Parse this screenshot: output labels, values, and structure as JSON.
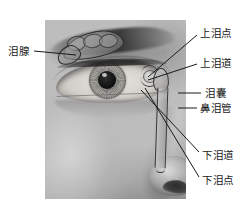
{
  "figure": {
    "type": "anatomical-diagram",
    "width": 252,
    "height": 211,
    "background_color": "#ffffff",
    "label_color": "#1a1a1a",
    "leader_line_color": "#1a1a1a"
  },
  "photo": {
    "description": "灰度人脸照片，显示左眼、眉毛、鼻侧",
    "left": 45,
    "top": 20,
    "width": 141,
    "height": 179
  },
  "labels": [
    {
      "id": "lacrimal-gland",
      "text": "泪腺",
      "side": "left",
      "text_x": 8,
      "text_y": 46,
      "leader": {
        "x1": 34,
        "y1": 51,
        "x2": 76,
        "y2": 55
      }
    },
    {
      "id": "superior-punctum",
      "text": "上泪点",
      "side": "right",
      "text_x": 200,
      "text_y": 28,
      "leader": {
        "x1": 197,
        "y1": 35,
        "x2": 148,
        "y2": 77
      }
    },
    {
      "id": "superior-canaliculus",
      "text": "上泪道",
      "side": "right",
      "text_x": 200,
      "text_y": 58,
      "leader": {
        "x1": 197,
        "y1": 64,
        "x2": 148,
        "y2": 80
      }
    },
    {
      "id": "lacrimal-sac",
      "text": "泪囊",
      "side": "right",
      "text_x": 205,
      "text_y": 88,
      "leader": {
        "x1": 201,
        "y1": 93,
        "x2": 178,
        "y2": 93
      }
    },
    {
      "id": "nasolacrimal-duct",
      "text": "鼻泪管",
      "side": "right",
      "text_x": 200,
      "text_y": 103,
      "leader": {
        "x1": 197,
        "y1": 108,
        "x2": 178,
        "y2": 108
      }
    },
    {
      "id": "inferior-canaliculus",
      "text": "下泪道",
      "side": "right",
      "text_x": 202,
      "text_y": 150,
      "leader": {
        "x1": 199,
        "y1": 152,
        "x2": 141,
        "y2": 90
      }
    },
    {
      "id": "inferior-punctum",
      "text": "下泪点",
      "side": "right",
      "text_x": 202,
      "text_y": 175,
      "leader": {
        "x1": 199,
        "y1": 177,
        "x2": 145,
        "y2": 88
      }
    }
  ]
}
